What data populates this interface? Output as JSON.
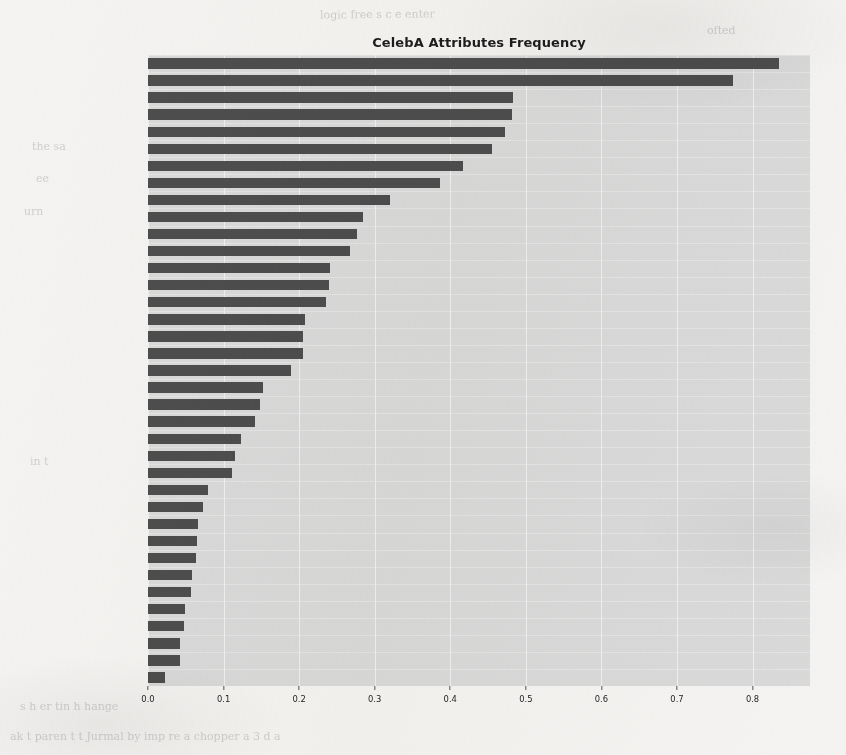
{
  "chart_data": {
    "type": "bar",
    "orientation": "horizontal",
    "title": "CelebA Attributes Frequency",
    "xlabel": "",
    "ylabel": "",
    "xlim": [
      0.0,
      0.835
    ],
    "grid": true,
    "legend": null,
    "bar_color": "#4d4d4d",
    "plot_background": "#d9d9d9",
    "gridline_color": "#f2f2f2",
    "figure_background": "#f4f3f1",
    "xticks": [
      "0.0",
      "0.1",
      "0.2",
      "0.3",
      "0.4",
      "0.5",
      "0.6",
      "0.7",
      "0.8"
    ],
    "xtick_values": [
      0.0,
      0.1,
      0.2,
      0.3,
      0.4,
      0.5,
      0.6,
      0.7,
      0.8
    ],
    "categories": [
      "No_Beard",
      "Young",
      "Mouth_Slightly_Open",
      "Smiling",
      "Wearing_Lipstick",
      "High_Cheekbones",
      "Male",
      "Heavy_Makeup",
      "Wavy_Hair",
      "Oval_Face",
      "Pointy_Nose",
      "Arched_Eyebrows",
      "Big_Lips",
      "Black_Hair",
      "Big_Nose",
      "Straight_Hair",
      "Brown_Hair",
      "Bags_Under_Eyes",
      "Wearing_Earrings",
      "Bangs",
      "Blond_Hair",
      "Bushy_Eyebrows",
      "Wearing_Necklace",
      "Narrow_Eyes",
      "5_o_Clock_Shadow",
      "Receding_Hairline",
      "Wearing_Necktie",
      "Rosy_Cheeks",
      "Eyeglasses",
      "Goatee",
      "Chubby",
      "Sideburns",
      "Wearing_Hat",
      "Double_Chin",
      "Gray_Hair",
      "Mustache",
      "Bald"
    ],
    "values": [
      0.835,
      0.774,
      0.483,
      0.482,
      0.472,
      0.455,
      0.417,
      0.387,
      0.32,
      0.284,
      0.277,
      0.267,
      0.241,
      0.239,
      0.235,
      0.208,
      0.205,
      0.205,
      0.189,
      0.152,
      0.148,
      0.142,
      0.123,
      0.115,
      0.111,
      0.08,
      0.073,
      0.066,
      0.065,
      0.063,
      0.058,
      0.057,
      0.049,
      0.047,
      0.042,
      0.042,
      0.022
    ]
  },
  "ghost_marks": [
    {
      "text": "logic free  s c  e  enter",
      "x": 320,
      "y": 8,
      "rotate": -0.6
    },
    {
      "text": "ofted",
      "x": 707,
      "y": 24,
      "rotate": 0
    },
    {
      "text": "the   sa",
      "x": 32,
      "y": 140,
      "rotate": 0
    },
    {
      "text": "ee",
      "x": 36,
      "y": 172,
      "rotate": 0
    },
    {
      "text": "urn",
      "x": 24,
      "y": 205,
      "rotate": 0
    },
    {
      "text": "in  t",
      "x": 30,
      "y": 455,
      "rotate": 0
    },
    {
      "text": "ak  t   paren  t t   Jurmal by  imp  re  a  chopper  a   3   d  a",
      "x": 10,
      "y": 730,
      "rotate": 0
    },
    {
      "text": "s  h  er tin  h   hange",
      "x": 20,
      "y": 700,
      "rotate": 0
    }
  ]
}
